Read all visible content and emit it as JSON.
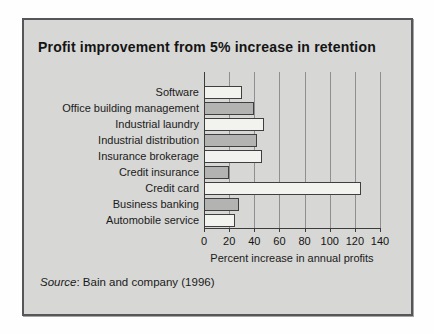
{
  "title": "Profit improvement from 5% increase in retention",
  "source": {
    "prefix": "Source",
    "rest": ": Bain and company (1996)"
  },
  "chart_data": {
    "type": "bar",
    "orientation": "horizontal",
    "title": "Profit improvement from 5% increase in retention",
    "categories": [
      "Software",
      "Office building management",
      "Industrial laundry",
      "Industrial distribution",
      "Insurance brokerage",
      "Credit insurance",
      "Credit card",
      "Business banking",
      "Automobile service"
    ],
    "values": [
      30,
      40,
      48,
      42,
      46,
      20,
      125,
      28,
      25
    ],
    "xlabel": "Percent increase in annual profits",
    "ylabel": "",
    "xticks": [
      0,
      20,
      40,
      60,
      80,
      100,
      120,
      140
    ],
    "xlim": [
      0,
      140
    ],
    "grid": "vertical gridlines at every tick, no horizontal gridlines",
    "legend": "none",
    "bar_fill_pattern": [
      "#f2f2ef",
      "#b3b3b1"
    ],
    "bar_border_color": "#3f3f3f"
  },
  "colors": {
    "page_bg": "#fefefe",
    "panel_bg": "#d7d7d5",
    "panel_border": "#55565a",
    "gridline": "#8f8f8f",
    "axis_line": "#3c3c3c",
    "text": "#141414"
  }
}
